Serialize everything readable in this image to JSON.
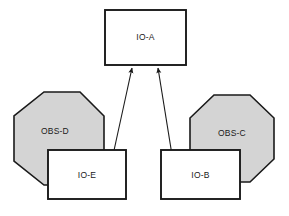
{
  "diagram": {
    "background_color": "#ffffff",
    "width": 289,
    "height": 216,
    "colors": {
      "node_fill": "#ffffff",
      "obstacle_fill": "#d4d4d4",
      "stroke": "#1a1a1a",
      "text": "#1a1a1a",
      "arrow": "#1a1a1a"
    },
    "nodes": [
      {
        "id": "io-a",
        "label": "IO-A",
        "shape": "rectangle",
        "fill": "#ffffff",
        "x": 105,
        "y": 10,
        "width": 81,
        "height": 55,
        "label_x": 145.5,
        "label_y": 37.5
      },
      {
        "id": "obs-d",
        "label": "OBS-D",
        "shape": "octagon",
        "fill": "#d4d4d4",
        "x": 14,
        "y": 92,
        "width": 90,
        "height": 93,
        "label_x": 55,
        "label_y": 131
      },
      {
        "id": "obs-c",
        "label": "OBS-C",
        "shape": "octagon",
        "fill": "#d4d4d4",
        "x": 190,
        "y": 95,
        "width": 84,
        "height": 87,
        "label_x": 232,
        "label_y": 133
      },
      {
        "id": "io-e",
        "label": "IO-E",
        "shape": "rectangle",
        "fill": "#ffffff",
        "x": 48,
        "y": 150,
        "width": 78,
        "height": 49,
        "label_x": 87,
        "label_y": 175
      },
      {
        "id": "io-b",
        "label": "IO-B",
        "shape": "rectangle",
        "fill": "#ffffff",
        "x": 161,
        "y": 150,
        "width": 79,
        "height": 49,
        "label_x": 200.5,
        "label_y": 175
      }
    ],
    "edges": [
      {
        "id": "io-e-to-io-a",
        "from": "io-e",
        "to": "io-a",
        "arrowhead": "solid-triangle",
        "x1": 113,
        "y1": 152,
        "x2": 132,
        "y2": 67
      },
      {
        "id": "io-b-to-io-a",
        "from": "io-b",
        "to": "io-a",
        "arrowhead": "solid-triangle",
        "x1": 172,
        "y1": 152,
        "x2": 158,
        "y2": 67
      }
    ]
  }
}
